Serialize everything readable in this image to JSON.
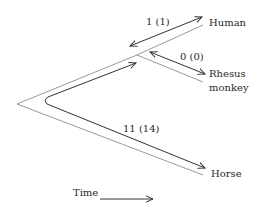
{
  "taxa": {
    "human": "Human",
    "rhesus_line1": "Rhesus",
    "rhesus_line2": "monkey",
    "horse": "Horse"
  },
  "distances": {
    "human_branch": "1 (1)",
    "rhesus_branch": "0 (0)",
    "horse_path": "11 (14)"
  },
  "axis": {
    "time_label": "Time"
  },
  "colors": {
    "tree_outline": "#9a9a9a",
    "arrows": "#333333",
    "background": "#ffffff"
  }
}
